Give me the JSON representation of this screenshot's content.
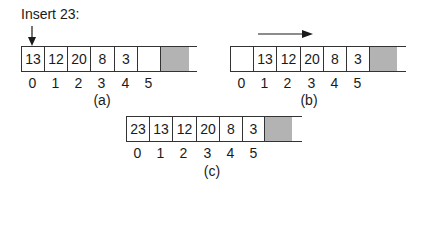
{
  "instruction": "Insert 23:",
  "panels": [
    {
      "id": "a",
      "caption": "(a)",
      "cells": [
        "13",
        "12",
        "20",
        "8",
        "3",
        ""
      ],
      "indices": [
        "0",
        "1",
        "2",
        "3",
        "4",
        "5"
      ],
      "arrow": "insert-down-arrow at index 0"
    },
    {
      "id": "b",
      "caption": "(b)",
      "cells": [
        "",
        "13",
        "12",
        "20",
        "8",
        "3"
      ],
      "indices": [
        "0",
        "1",
        "2",
        "3",
        "4",
        "5"
      ],
      "arrow": "shift-right-arrow"
    },
    {
      "id": "c",
      "caption": "(c)",
      "cells": [
        "23",
        "13",
        "12",
        "20",
        "8",
        "3"
      ],
      "indices": [
        "0",
        "1",
        "2",
        "3",
        "4",
        "5"
      ]
    }
  ],
  "colors": {
    "line": "#333333",
    "unused_cell": "#b3b3b3",
    "background": "#ffffff"
  }
}
